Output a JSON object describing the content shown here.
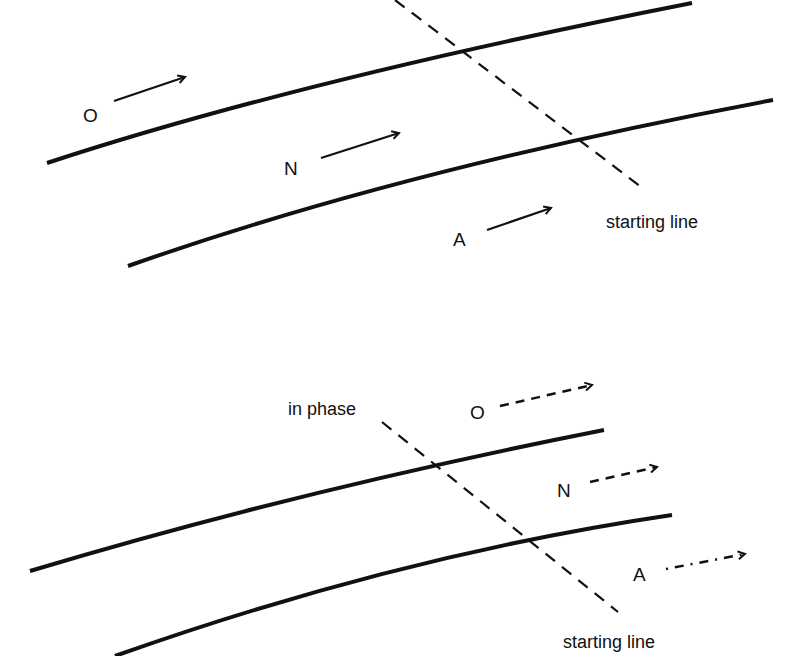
{
  "top_panel": {
    "arrows": [
      {
        "label": "O",
        "style": "solid"
      },
      {
        "label": "N",
        "style": "solid"
      },
      {
        "label": "A",
        "style": "solid"
      }
    ],
    "dashed_line_label": "starting line"
  },
  "bottom_panel": {
    "arrows": [
      {
        "label": "O",
        "style": "dashed"
      },
      {
        "label": "N",
        "style": "dashed"
      },
      {
        "label": "A",
        "style": "dashed"
      }
    ],
    "dashed_line_top_label": "in phase",
    "dashed_line_bottom_label": "starting line"
  },
  "colors": {
    "ink": "#111111",
    "background": "#ffffff"
  }
}
